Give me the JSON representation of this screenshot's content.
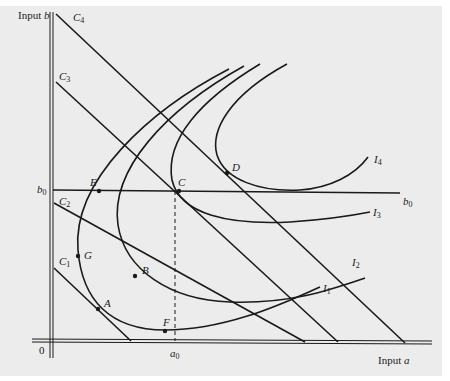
{
  "diagram": {
    "type": "isoquant-isocost",
    "axes": {
      "y_label": "Input b",
      "y_label_prefix": "Input",
      "y_label_var": "b",
      "x_label_prefix": "Input",
      "x_label_var": "a",
      "origin": "0"
    },
    "reference_values": {
      "b0": {
        "base": "b",
        "sub": "0"
      },
      "a0": {
        "base": "a",
        "sub": "0"
      }
    },
    "isocost_lines": [
      {
        "base": "C",
        "sub": "1"
      },
      {
        "base": "C",
        "sub": "2"
      },
      {
        "base": "C",
        "sub": "3"
      },
      {
        "base": "C",
        "sub": "4"
      }
    ],
    "isoquants": [
      {
        "base": "I",
        "sub": "1"
      },
      {
        "base": "I",
        "sub": "2"
      },
      {
        "base": "I",
        "sub": "3"
      },
      {
        "base": "I",
        "sub": "4"
      }
    ],
    "points": {
      "A": "A",
      "B": "B",
      "C": "C",
      "D": "D",
      "E": "E",
      "F": "F",
      "G": "G"
    },
    "colors": {
      "background": "#ececec",
      "ink": "#1a1a1a"
    }
  }
}
